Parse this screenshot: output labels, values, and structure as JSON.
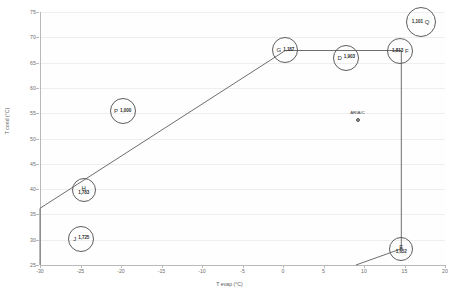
{
  "chart_data": {
    "type": "scatter",
    "title": "",
    "xlabel": "T evap (°C)",
    "ylabel": "T cond (°C)",
    "xlim": [
      -30,
      20
    ],
    "ylim": [
      25,
      75
    ],
    "xticks": [
      "-30",
      "-25",
      "-20",
      "-15",
      "-10",
      "-5",
      "0",
      "5",
      "10",
      "15",
      "20"
    ],
    "yticks": [
      "25",
      "30",
      "35",
      "40",
      "45",
      "50",
      "55",
      "60",
      "65",
      "70",
      "75"
    ],
    "grid": true,
    "legend": "none",
    "bubbles": [
      {
        "letter": "Q",
        "value": "1,101",
        "x": 17.0,
        "y": 73.0,
        "r": 15,
        "layout": "value-left"
      },
      {
        "letter": "F",
        "value": "1,813",
        "x": 14.5,
        "y": 67.3,
        "r": 13,
        "layout": "value-left"
      },
      {
        "letter": "G",
        "value": "1,187",
        "x": 0.3,
        "y": 67.4,
        "r": 13,
        "layout": "value-right"
      },
      {
        "letter": "D",
        "value": "1,903",
        "x": 7.8,
        "y": 66.0,
        "r": 13,
        "layout": "value-right"
      },
      {
        "letter": "P",
        "value": "1,000",
        "x": -19.8,
        "y": 55.4,
        "r": 13,
        "layout": "value-right"
      },
      {
        "letter": "H",
        "value": "1,783",
        "x": -24.6,
        "y": 39.8,
        "r": 12,
        "layout": "stacked"
      },
      {
        "letter": "J",
        "value": "1,725",
        "x": -24.9,
        "y": 30.2,
        "r": 13,
        "layout": "value-right"
      },
      {
        "letter": "E",
        "value": "1,652",
        "x": 14.6,
        "y": 28.2,
        "r": 12,
        "layout": "stacked"
      }
    ],
    "points": [
      {
        "label": "ARIA/C",
        "x": 9.2,
        "y": 53.6
      }
    ],
    "envelope": {
      "name": "operating-envelope",
      "stroke": "#5d5d5d",
      "vertices": [
        {
          "x": -30.0,
          "y": 25.0
        },
        {
          "x": -30.0,
          "y": 36.2
        },
        {
          "x": 0.3,
          "y": 67.4
        },
        {
          "x": 14.6,
          "y": 67.4
        },
        {
          "x": 14.6,
          "y": 28.2
        },
        {
          "x": 9.0,
          "y": 25.0
        }
      ]
    }
  }
}
